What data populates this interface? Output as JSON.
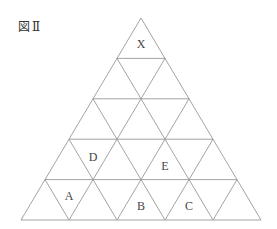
{
  "figure": {
    "title": "図Ⅱ",
    "rows": 5,
    "line_color": "#999999",
    "labels": [
      {
        "text": "X",
        "x": 141,
        "y": 48
      },
      {
        "text": "D",
        "x": 93,
        "y": 161
      },
      {
        "text": "E",
        "x": 165,
        "y": 170
      },
      {
        "text": "A",
        "x": 69,
        "y": 200
      },
      {
        "text": "B",
        "x": 141,
        "y": 210
      },
      {
        "text": "C",
        "x": 189,
        "y": 210
      }
    ]
  }
}
